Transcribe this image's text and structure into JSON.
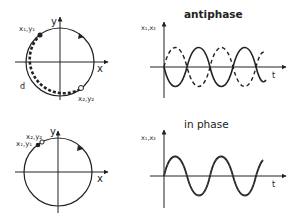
{
  "panels": [
    {
      "title": "antiphase",
      "circle": {
        "x_axis_label": "x",
        "y_axis_label": "y",
        "point1_label": "x₁,y₁",
        "point2_label": "x₂,y₂",
        "distance_label": "d"
      },
      "plot": {
        "y_axis_label": "x₁,x₂",
        "x_axis_label": "t",
        "series": [
          {
            "name": "x1",
            "style": "solid",
            "phase": "sin"
          },
          {
            "name": "x2",
            "style": "dashed",
            "phase": "-sin"
          }
        ]
      }
    },
    {
      "title": "in phase",
      "circle": {
        "x_axis_label": "x",
        "y_axis_label": "y",
        "point1_label": "x₁,y₁",
        "point2_label": "x₂,y₂"
      },
      "plot": {
        "y_axis_label": "x₁,x₂",
        "x_axis_label": "t",
        "series": [
          {
            "name": "x1",
            "style": "solid",
            "phase": "sin"
          },
          {
            "name": "x2",
            "style": "dashed",
            "phase": "sin"
          }
        ]
      }
    }
  ],
  "colors": {
    "line": "#222222",
    "background": "#ffffff"
  }
}
